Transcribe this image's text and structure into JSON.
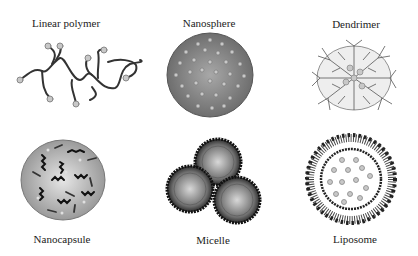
{
  "figure": {
    "panels": [
      {
        "id": "linear-polymer",
        "label": "Linear polymer",
        "row": 1,
        "col": 1
      },
      {
        "id": "nanosphere",
        "label": "Nanosphere",
        "row": 1,
        "col": 2
      },
      {
        "id": "dendrimer",
        "label": "Dendrimer",
        "row": 1,
        "col": 3
      },
      {
        "id": "nanocapsule",
        "label": "Nanocapsule",
        "row": 2,
        "col": 1
      },
      {
        "id": "micelle",
        "label": "Micelle",
        "row": 2,
        "col": 2
      },
      {
        "id": "liposome",
        "label": "Liposome",
        "row": 2,
        "col": 3
      }
    ],
    "colors": {
      "sphere_fill": "#8c8c8c",
      "dot_fill": "#c8c8c8",
      "line": "#333333",
      "capsule_fill": "#b5b5b5"
    }
  }
}
